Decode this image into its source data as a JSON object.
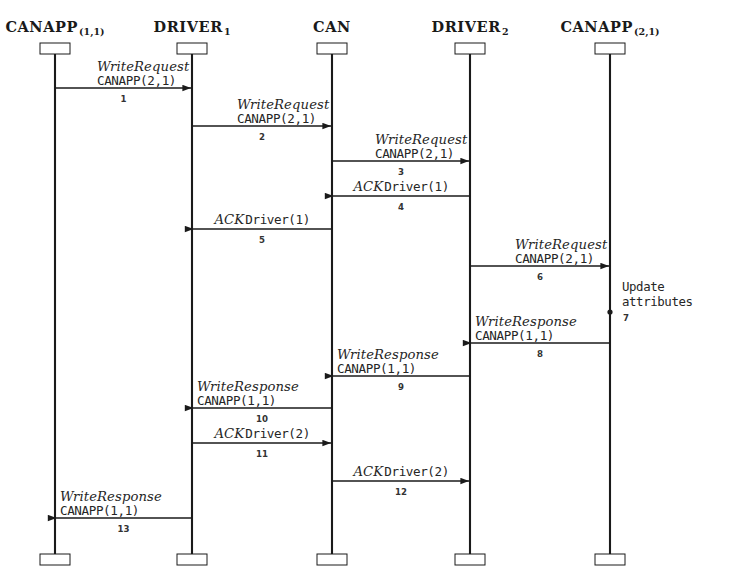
{
  "diagram": {
    "type": "uml-sequence-diagram",
    "width": 737,
    "height": 588,
    "colors": {
      "line": "#1a1a1a",
      "text": "#262626",
      "background": "#ffffff",
      "box_fill": "#ffffff"
    },
    "lifeline": {
      "top_y": 52,
      "bottom_y": 556,
      "box_width": 30,
      "box_height": 11
    }
  },
  "participants": [
    {
      "id": "canapp11",
      "name": "CANAPP",
      "subscript": "(1,1)",
      "x": 55
    },
    {
      "id": "driver1",
      "name": "DRIVER",
      "subscript": "1",
      "x": 192
    },
    {
      "id": "can",
      "name": "CAN",
      "subscript": "",
      "x": 332
    },
    {
      "id": "driver2",
      "name": "DRIVER",
      "subscript": "2",
      "x": 470
    },
    {
      "id": "canapp21",
      "name": "CANAPP",
      "subscript": "(2,1)",
      "x": 610
    }
  ],
  "messages": [
    {
      "num": "1",
      "line1": "WriteRequest",
      "line2": "CANAPP(2,1)",
      "from": "canapp11",
      "to": "driver1",
      "y": 88,
      "dir": "right",
      "layout": "stacked"
    },
    {
      "num": "2",
      "line1": "WriteRequest",
      "line2": "CANAPP(2,1)",
      "from": "driver1",
      "to": "can",
      "y": 126,
      "dir": "right",
      "layout": "stacked"
    },
    {
      "num": "3",
      "line1": "WriteRequest",
      "line2": "CANAPP(2,1)",
      "from": "can",
      "to": "driver2",
      "y": 161,
      "dir": "right",
      "layout": "stacked"
    },
    {
      "num": "4",
      "line1": "ACK",
      "line2": "Driver(1)",
      "from": "driver2",
      "to": "can",
      "y": 196,
      "dir": "left",
      "layout": "inline"
    },
    {
      "num": "5",
      "line1": "ACK",
      "line2": "Driver(1)",
      "from": "can",
      "to": "driver1",
      "y": 229,
      "dir": "left",
      "layout": "inline"
    },
    {
      "num": "6",
      "line1": "WriteRequest",
      "line2": "CANAPP(2,1)",
      "from": "driver2",
      "to": "canapp21",
      "y": 266,
      "dir": "right",
      "layout": "stacked"
    },
    {
      "num": "8",
      "line1": "WriteResponse",
      "line2": "CANAPP(1,1)",
      "from": "canapp21",
      "to": "driver2",
      "y": 343,
      "dir": "left",
      "layout": "stacked"
    },
    {
      "num": "9",
      "line1": "WriteResponse",
      "line2": "CANAPP(1,1)",
      "from": "driver2",
      "to": "can",
      "y": 376,
      "dir": "left",
      "layout": "stacked"
    },
    {
      "num": "10",
      "line1": "WriteResponse",
      "line2": "CANAPP(1,1)",
      "from": "can",
      "to": "driver1",
      "y": 408,
      "dir": "left",
      "layout": "stacked"
    },
    {
      "num": "11",
      "line1": "ACK",
      "line2": "Driver(2)",
      "from": "driver1",
      "to": "can",
      "y": 443,
      "dir": "right",
      "layout": "inline"
    },
    {
      "num": "12",
      "line1": "ACK",
      "line2": "Driver(2)",
      "from": "can",
      "to": "driver2",
      "y": 481,
      "dir": "right",
      "layout": "inline"
    },
    {
      "num": "13",
      "line1": "WriteResponse",
      "line2": "CANAPP(1,1)",
      "from": "driver1",
      "to": "canapp11",
      "y": 518,
      "dir": "left",
      "layout": "stacked"
    }
  ],
  "notes": [
    {
      "num": "7",
      "text_line1": "Update",
      "text_line2": "attributes",
      "on": "canapp21",
      "y_start": 266,
      "y_end": 312,
      "label_x": 622,
      "label_y": 280,
      "num_x": 626,
      "num_y": 313
    }
  ]
}
